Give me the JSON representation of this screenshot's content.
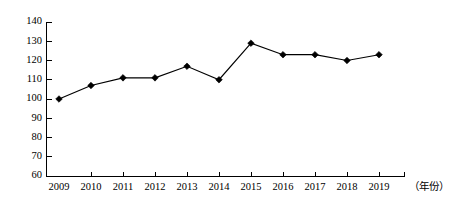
{
  "chart_data": {
    "type": "line",
    "title": "",
    "subtitle": "",
    "xlabel": "（年份）",
    "ylabel": "",
    "categories": [
      "2009",
      "2010",
      "2011",
      "2012",
      "2013",
      "2014",
      "2015",
      "2016",
      "2017",
      "2018",
      "2019"
    ],
    "values": [
      100,
      107,
      111,
      111,
      117,
      110,
      129,
      123,
      123,
      120,
      123
    ],
    "series": [
      {
        "name": "",
        "values": [
          100,
          107,
          111,
          111,
          117,
          110,
          129,
          123,
          123,
          120,
          123
        ]
      }
    ],
    "ylim": [
      60,
      140
    ],
    "ytick_step": 10,
    "ytick_labels": [
      "140",
      "130",
      "120",
      "110",
      "100",
      "90",
      "80",
      "70",
      "60"
    ],
    "ytick_values": [
      140,
      130,
      120,
      110,
      100,
      90,
      80,
      70,
      60
    ],
    "xtick_labels": [
      "2009",
      "2010",
      "2011",
      "2012",
      "2013",
      "2014",
      "2015",
      "2016",
      "2017",
      "2018",
      "2019"
    ],
    "grid": false,
    "legend": "none",
    "marker": "diamond",
    "line_color": "#000000",
    "marker_color": "#000000",
    "axis_color": "#000000",
    "background_color": "#ffffff"
  },
  "axis_caption": {
    "text": "（年份）"
  }
}
